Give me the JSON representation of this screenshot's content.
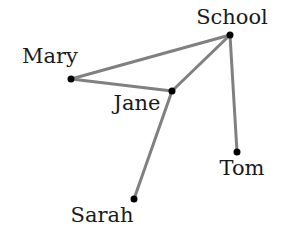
{
  "diagram": {
    "type": "network",
    "nodes": [
      {
        "id": "school",
        "label": "School",
        "x": 230,
        "y": 35,
        "label_x": 232,
        "label_y": 24,
        "anchor": "middle"
      },
      {
        "id": "mary",
        "label": "Mary",
        "x": 71,
        "y": 79,
        "label_x": 50,
        "label_y": 63,
        "anchor": "middle"
      },
      {
        "id": "jane",
        "label": "Jane",
        "x": 172,
        "y": 91,
        "label_x": 137,
        "label_y": 110,
        "anchor": "middle"
      },
      {
        "id": "tom",
        "label": "Tom",
        "x": 237,
        "y": 152,
        "label_x": 242,
        "label_y": 175,
        "anchor": "middle"
      },
      {
        "id": "sarah",
        "label": "Sarah",
        "x": 134,
        "y": 199,
        "label_x": 102,
        "label_y": 222,
        "anchor": "middle"
      }
    ],
    "edges": [
      {
        "from": "mary",
        "to": "school"
      },
      {
        "from": "mary",
        "to": "jane"
      },
      {
        "from": "jane",
        "to": "school"
      },
      {
        "from": "school",
        "to": "tom"
      },
      {
        "from": "jane",
        "to": "sarah"
      }
    ],
    "colors": {
      "edge": "#808080",
      "node": "#000000",
      "label": "#1a1a1a",
      "background": "#ffffff"
    }
  }
}
